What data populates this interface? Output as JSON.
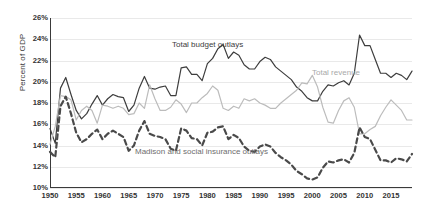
{
  "chart_data": {
    "type": "line",
    "title": "",
    "xlabel": "",
    "ylabel": "Percent of GDP",
    "ylim": [
      10,
      26
    ],
    "xlim": [
      1950,
      2019
    ],
    "grid": true,
    "legend_position": "inline-annotations",
    "y_ticks": [
      "10%",
      "12%",
      "14%",
      "16%",
      "18%",
      "20%",
      "22%",
      "24%",
      "26%"
    ],
    "y_tick_values": [
      10,
      12,
      14,
      16,
      18,
      20,
      22,
      24,
      26
    ],
    "x_ticks": [
      "1950",
      "1955",
      "1960",
      "1965",
      "1970",
      "1975",
      "1980",
      "1985",
      "1990",
      "1995",
      "2000",
      "2005",
      "2010",
      "2015"
    ],
    "x_tick_values": [
      1950,
      1955,
      1960,
      1965,
      1970,
      1975,
      1980,
      1985,
      1990,
      1995,
      2000,
      2005,
      2010,
      2015
    ],
    "annotations": [
      {
        "text": "Total budget outlays",
        "series": "Total budget outlays"
      },
      {
        "text": "Total revenue",
        "series": "Total revenue"
      },
      {
        "text": "Madison and social insurance outlays",
        "series": "Madison and social insurance outlays"
      }
    ],
    "x": [
      1950,
      1951,
      1952,
      1953,
      1954,
      1955,
      1956,
      1957,
      1958,
      1959,
      1960,
      1961,
      1962,
      1963,
      1964,
      1965,
      1966,
      1967,
      1968,
      1969,
      1970,
      1971,
      1972,
      1973,
      1974,
      1975,
      1976,
      1977,
      1978,
      1979,
      1980,
      1981,
      1982,
      1983,
      1984,
      1985,
      1986,
      1987,
      1988,
      1989,
      1990,
      1991,
      1992,
      1993,
      1994,
      1995,
      1996,
      1997,
      1998,
      1999,
      2000,
      2001,
      2002,
      2003,
      2004,
      2005,
      2006,
      2007,
      2008,
      2009,
      2010,
      2011,
      2012,
      2013,
      2014,
      2015,
      2016,
      2017,
      2018,
      2019
    ],
    "series": [
      {
        "name": "Total budget outlays",
        "color": "#3d3d3d",
        "style": "solid",
        "width": 1.2,
        "values": [
          15.6,
          14.2,
          19.4,
          20.4,
          18.8,
          17.3,
          16.5,
          17.0,
          17.9,
          18.7,
          17.8,
          18.4,
          18.8,
          18.6,
          18.5,
          17.2,
          17.8,
          19.4,
          20.5,
          19.4,
          19.3,
          19.5,
          19.6,
          18.7,
          18.7,
          21.3,
          21.4,
          20.7,
          20.7,
          20.1,
          21.7,
          22.2,
          23.1,
          23.5,
          22.2,
          22.8,
          22.5,
          21.6,
          21.2,
          21.2,
          21.9,
          22.3,
          22.1,
          21.4,
          21.0,
          20.6,
          20.2,
          19.5,
          19.1,
          18.5,
          18.2,
          18.2,
          19.1,
          19.7,
          19.6,
          19.9,
          20.1,
          19.7,
          20.8,
          24.4,
          23.4,
          23.4,
          22.1,
          20.8,
          20.8,
          20.4,
          20.8,
          20.6,
          20.2,
          21.0
        ]
      },
      {
        "name": "Total revenue",
        "color": "#bcbcbc",
        "style": "solid",
        "width": 1.2,
        "values": [
          14.1,
          15.8,
          18.7,
          18.6,
          18.3,
          16.4,
          17.3,
          17.7,
          17.3,
          16.1,
          17.8,
          17.7,
          17.5,
          17.7,
          17.5,
          16.9,
          17.0,
          18.0,
          17.5,
          19.7,
          18.4,
          17.3,
          17.3,
          17.6,
          18.3,
          17.9,
          17.1,
          18.0,
          18.0,
          18.5,
          18.9,
          19.6,
          19.2,
          17.5,
          17.3,
          17.7,
          17.5,
          18.4,
          18.2,
          18.4,
          18.0,
          17.8,
          17.5,
          17.5,
          18.0,
          18.4,
          18.8,
          19.2,
          19.9,
          19.8,
          20.6,
          19.5,
          17.6,
          16.2,
          16.1,
          17.3,
          18.2,
          18.5,
          17.6,
          15.1,
          15.1,
          15.5,
          15.8,
          16.8,
          17.6,
          18.3,
          17.8,
          17.3,
          16.4,
          16.4
        ]
      },
      {
        "name": "Madison and social insurance outlays",
        "color": "#4a4a4a",
        "style": "dashed",
        "width": 2.2,
        "values": [
          13.4,
          12.9,
          17.7,
          18.6,
          17.0,
          15.2,
          14.3,
          14.6,
          15.1,
          15.5,
          14.6,
          15.1,
          15.4,
          15.1,
          14.8,
          13.5,
          14.0,
          15.4,
          16.3,
          15.1,
          14.9,
          14.8,
          14.6,
          13.7,
          13.5,
          15.6,
          15.4,
          14.7,
          14.6,
          14.0,
          15.2,
          15.3,
          15.7,
          15.8,
          14.6,
          15.0,
          14.7,
          13.9,
          13.5,
          13.4,
          13.9,
          14.1,
          13.9,
          13.3,
          12.9,
          12.6,
          12.2,
          11.6,
          11.3,
          10.9,
          10.8,
          11.0,
          11.9,
          12.5,
          12.4,
          12.6,
          12.7,
          12.4,
          13.3,
          15.7,
          14.8,
          14.6,
          13.6,
          12.6,
          12.6,
          12.4,
          12.8,
          12.7,
          12.5,
          13.2
        ]
      }
    ]
  },
  "labels": {
    "y_axis_title": "Percent of GDP",
    "total_budget_outlays": "Total budget outlays",
    "total_revenue": "Total revenue",
    "madison_social_insurance": "Madison and social insurance outlays"
  }
}
